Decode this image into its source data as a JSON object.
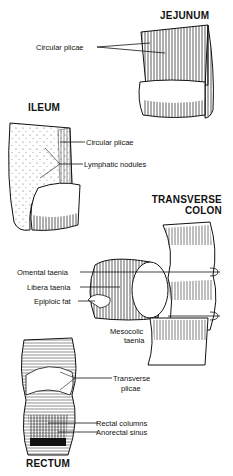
{
  "diagram": {
    "sections": [
      {
        "title": "JEJUNUM",
        "labels": [
          "Circular plicae"
        ]
      },
      {
        "title": "ILEUM",
        "labels": [
          "Circular plicae",
          "Lymphatic nodules"
        ]
      },
      {
        "title_line1": "TRANSVERSE",
        "title_line2": "COLON",
        "labels": [
          "Omental taenia",
          "Libera taenia",
          "Epiploic fat",
          "Mesocolic",
          "taenia"
        ]
      },
      {
        "title": "RECTUM",
        "labels": [
          "Transverse",
          "plicae",
          "Rectal columns",
          "Anorectal sinus"
        ]
      }
    ]
  }
}
